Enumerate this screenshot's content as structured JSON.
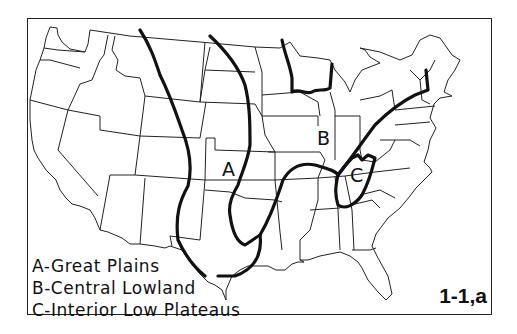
{
  "figure": {
    "label": "1-1,a"
  },
  "regions": [
    {
      "letter": "A",
      "name": "Great Plains"
    },
    {
      "letter": "B",
      "name": "Central Lowland"
    },
    {
      "letter": "C",
      "name": "Interior Low Plateaus"
    }
  ],
  "legend": {
    "items": [
      "A-Great Plains",
      "B-Central Lowland",
      "C-Interior Low Plateaus"
    ]
  },
  "map_labels": {
    "a": "A",
    "b": "B",
    "c": "C"
  },
  "colors": {
    "background": "#ffffff",
    "lines": "#111111"
  }
}
